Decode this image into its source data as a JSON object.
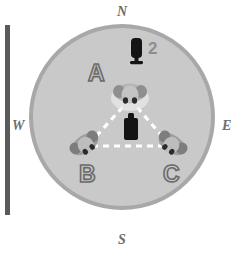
{
  "figure": {
    "type": "schematic-diagram",
    "background_color": "#ffffff",
    "arena": {
      "shape": "circle",
      "fill_color": "#c9c9c9",
      "ring_color": "#a8a8a8",
      "center": {
        "x": 122,
        "y": 117
      },
      "radius": 93
    },
    "edge_bar": {
      "name": "left-margin-bar",
      "color": "#5a5a5a"
    }
  },
  "compass": {
    "north": "N",
    "south": "S",
    "west": "W",
    "east": "E",
    "color": "#6e6e6e"
  },
  "arena_labels": [
    {
      "id": "A",
      "text": "A",
      "x": 88,
      "y": 62
    },
    {
      "id": "B",
      "text": "B",
      "x": 79,
      "y": 163
    },
    {
      "id": "C",
      "text": "C",
      "x": 163,
      "y": 163
    }
  ],
  "callouts": [
    {
      "id": "speaker-number",
      "text": "2",
      "color": "#8e8e8e",
      "x": 148,
      "y": 39
    }
  ],
  "objects": [
    {
      "name": "speaker-cue-north",
      "kind": "dark-speaker",
      "color": "#151515",
      "x": 136,
      "y": 52,
      "description": "dark upright object at north of arena"
    },
    {
      "name": "speaker-cue-center",
      "kind": "dark-speaker",
      "color": "#151515",
      "x": 131,
      "y": 126,
      "description": "dark upright object at arena center"
    },
    {
      "name": "animal-a",
      "kind": "animal-overhead",
      "body_color": "#b4b4b4",
      "ear_color": "#6b6b6b",
      "x": 130,
      "y": 93,
      "rotation": 0,
      "label": "A"
    },
    {
      "name": "animal-b",
      "kind": "animal-overhead",
      "body_color": "#b4b4b4",
      "ear_color": "#6b6b6b",
      "x": 85,
      "y": 144,
      "rotation": -40,
      "label": "B"
    },
    {
      "name": "animal-c",
      "kind": "animal-overhead",
      "body_color": "#b4b4b4",
      "ear_color": "#6b6b6b",
      "x": 172,
      "y": 144,
      "rotation": 40,
      "label": "C"
    }
  ],
  "connections": {
    "style": "white-dashed",
    "color": "#ffffff",
    "vertices": [
      {
        "label": "A",
        "x": 130,
        "y": 97
      },
      {
        "label": "B",
        "x": 90,
        "y": 143
      },
      {
        "label": "C",
        "x": 168,
        "y": 143
      }
    ],
    "edges": [
      {
        "from": "A",
        "to": "B"
      },
      {
        "from": "A",
        "to": "C"
      },
      {
        "from": "B",
        "to": "C"
      }
    ]
  }
}
